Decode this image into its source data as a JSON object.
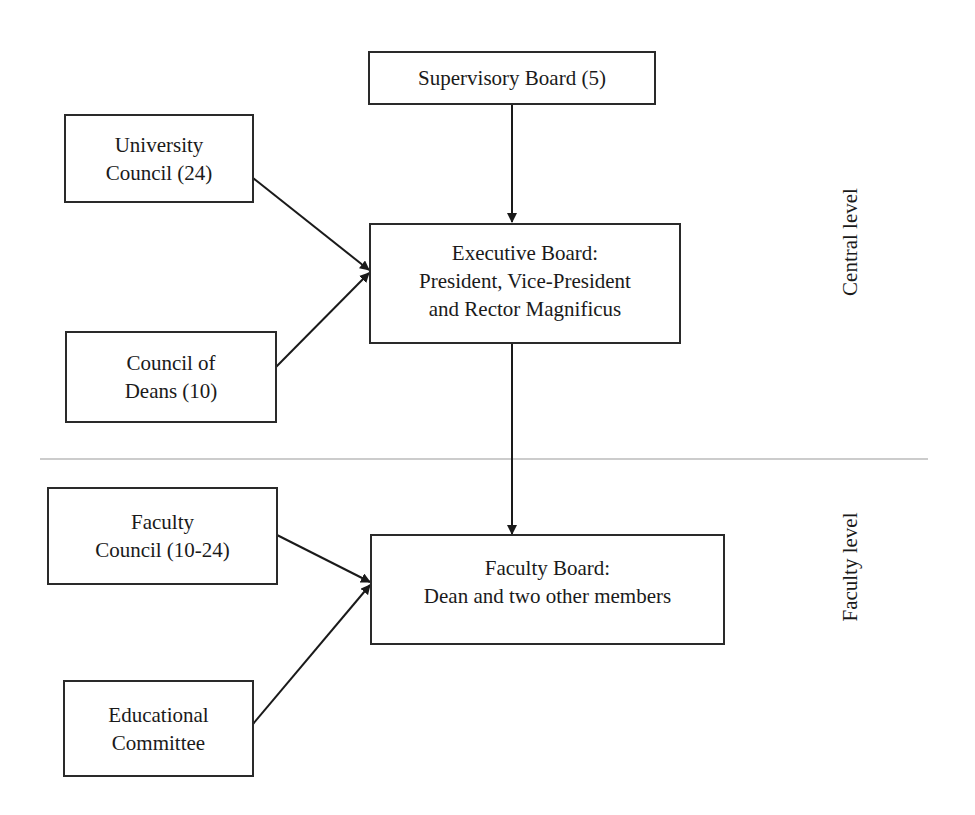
{
  "diagram": {
    "type": "organizational-structure",
    "levels": {
      "central": "Central level",
      "faculty": "Faculty level"
    },
    "nodes": {
      "supervisory_board": {
        "lines": [
          "Supervisory Board (5)"
        ]
      },
      "university_council": {
        "lines": [
          "University",
          "Council (24)"
        ]
      },
      "council_of_deans": {
        "lines": [
          "Council of",
          "Deans (10)"
        ]
      },
      "executive_board": {
        "lines": [
          "Executive Board:",
          "President, Vice-President",
          "and Rector Magnificus"
        ]
      },
      "faculty_council": {
        "lines": [
          "Faculty",
          "Council (10-24)"
        ]
      },
      "educational_committee": {
        "lines": [
          "Educational",
          "Committee"
        ]
      },
      "faculty_board": {
        "lines": [
          "Faculty Board:",
          "Dean and two other members"
        ]
      }
    },
    "edges": [
      {
        "from": "supervisory_board",
        "to": "executive_board"
      },
      {
        "from": "university_council",
        "to": "executive_board"
      },
      {
        "from": "council_of_deans",
        "to": "executive_board"
      },
      {
        "from": "executive_board",
        "to": "faculty_board"
      },
      {
        "from": "faculty_council",
        "to": "faculty_board"
      },
      {
        "from": "educational_committee",
        "to": "faculty_board"
      }
    ],
    "colors": {
      "line": "#1a1a1a",
      "divider": "#9a9a9a",
      "text": "#1a1a1a"
    }
  }
}
